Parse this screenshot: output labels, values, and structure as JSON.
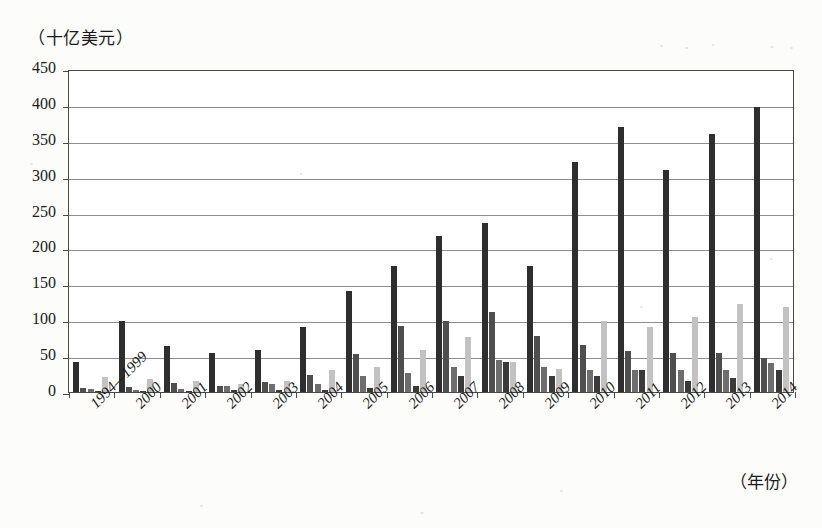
{
  "axes": {
    "y_unit_label": "（十亿美元）",
    "x_unit_label": "（年份）",
    "y_ticks": [
      "450",
      "400",
      "350",
      "300",
      "250",
      "200",
      "150",
      "100",
      "50",
      "0"
    ]
  },
  "colors": {
    "series1": "#2e2e2e",
    "series2": "#4f4f4f",
    "series3": "#6e6e6e",
    "series4": "#3a3a3a",
    "series5": "#c2c2c2",
    "grid": "#8e8e8e",
    "frame": "#4a4a4a",
    "page": "#fcfcfa"
  },
  "chart_data": {
    "type": "bar",
    "title": "",
    "xlabel": "（年份）",
    "ylabel": "（十亿美元）",
    "ylim": [
      0,
      450
    ],
    "ytick_step": 50,
    "grid": true,
    "legend": "none",
    "categories": [
      "1994—1999",
      "2000",
      "2001",
      "2002",
      "2003",
      "2004",
      "2005",
      "2006",
      "2007",
      "2008",
      "2009",
      "2010",
      "2011",
      "2012",
      "2013",
      "2014"
    ],
    "series": [
      {
        "name": "series-1",
        "values": [
          42,
          99,
          64,
          54,
          58,
          91,
          141,
          176,
          217,
          235,
          176,
          321,
          369,
          310,
          360,
          397
        ]
      },
      {
        "name": "series-2",
        "values": [
          6,
          7,
          13,
          9,
          14,
          24,
          53,
          92,
          99,
          112,
          78,
          65,
          57,
          55,
          55,
          48
        ]
      },
      {
        "name": "series-3",
        "values": [
          4,
          3,
          4,
          8,
          11,
          11,
          22,
          27,
          35,
          45,
          35,
          30,
          31,
          30,
          30,
          40
        ]
      },
      {
        "name": "series-4",
        "values": [
          1,
          1,
          2,
          3,
          3,
          3,
          5,
          8,
          22,
          42,
          23,
          23,
          30,
          16,
          20,
          30
        ]
      },
      {
        "name": "series-5",
        "values": [
          21,
          18,
          15,
          11,
          15,
          30,
          35,
          58,
          77,
          42,
          32,
          99,
          91,
          105,
          122,
          118
        ]
      }
    ]
  }
}
